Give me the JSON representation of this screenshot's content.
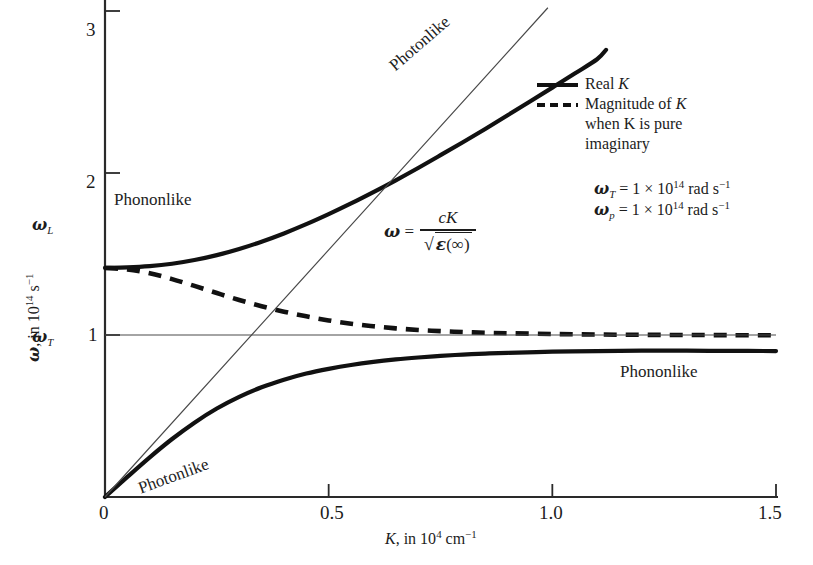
{
  "chart_data": {
    "type": "line",
    "title": "",
    "xlabel": "K, in 10^4 cm^-1",
    "ylabel": "ω, in 10^14 s^-1",
    "xlim": [
      0,
      1.5
    ],
    "ylim": [
      0,
      3.1
    ],
    "xticks": [
      "0",
      "0.5",
      "1.0",
      "1.5"
    ],
    "xtick_values": [
      0,
      0.5,
      1.0,
      1.5
    ],
    "yticks": [
      "1",
      "2",
      "3"
    ],
    "ytick_values": [
      1,
      2,
      3
    ],
    "grid": false,
    "legend_position": "upper-right",
    "special_levels": [
      {
        "name": "omega_T",
        "label": "ω",
        "sub": "T",
        "value": 1.0
      },
      {
        "name": "omega_L",
        "label": "ω",
        "sub": "L",
        "value": 1.41
      }
    ],
    "series": [
      {
        "name": "Upper polariton branch (Real K)",
        "style": "solid",
        "annotation": "Photonlike",
        "points": [
          [
            0.0,
            1.414
          ],
          [
            0.05,
            1.417
          ],
          [
            0.1,
            1.425
          ],
          [
            0.15,
            1.44
          ],
          [
            0.2,
            1.463
          ],
          [
            0.25,
            1.493
          ],
          [
            0.3,
            1.531
          ],
          [
            0.35,
            1.576
          ],
          [
            0.4,
            1.627
          ],
          [
            0.45,
            1.684
          ],
          [
            0.5,
            1.746
          ],
          [
            0.55,
            1.812
          ],
          [
            0.6,
            1.882
          ],
          [
            0.65,
            1.955
          ],
          [
            0.7,
            2.031
          ],
          [
            0.75,
            2.11
          ],
          [
            0.8,
            2.19
          ],
          [
            0.85,
            2.272
          ],
          [
            0.9,
            2.356
          ],
          [
            0.95,
            2.441
          ],
          [
            1.0,
            2.527
          ],
          [
            1.05,
            2.614
          ],
          [
            1.1,
            2.702
          ],
          [
            1.12,
            2.76
          ]
        ]
      },
      {
        "name": "Lower polariton branch (Real K)",
        "style": "solid",
        "annotations": [
          "Photonlike",
          "Phononlike"
        ],
        "points": [
          [
            0.0,
            0.0
          ],
          [
            0.05,
            0.124
          ],
          [
            0.1,
            0.245
          ],
          [
            0.15,
            0.358
          ],
          [
            0.2,
            0.459
          ],
          [
            0.25,
            0.546
          ],
          [
            0.3,
            0.618
          ],
          [
            0.35,
            0.677
          ],
          [
            0.4,
            0.724
          ],
          [
            0.45,
            0.762
          ],
          [
            0.5,
            0.791
          ],
          [
            0.55,
            0.815
          ],
          [
            0.6,
            0.834
          ],
          [
            0.65,
            0.849
          ],
          [
            0.7,
            0.861
          ],
          [
            0.75,
            0.871
          ],
          [
            0.8,
            0.879
          ],
          [
            0.85,
            0.885
          ],
          [
            0.9,
            0.89
          ],
          [
            1.0,
            0.897
          ],
          [
            1.1,
            0.901
          ],
          [
            1.2,
            0.903
          ],
          [
            1.3,
            0.903
          ],
          [
            1.4,
            0.902
          ],
          [
            1.5,
            0.901
          ]
        ]
      },
      {
        "name": "Magnitude of K when K is pure imaginary",
        "style": "dashed",
        "points": [
          [
            0.0,
            1.414
          ],
          [
            0.05,
            1.405
          ],
          [
            0.1,
            1.381
          ],
          [
            0.15,
            1.345
          ],
          [
            0.2,
            1.303
          ],
          [
            0.25,
            1.259
          ],
          [
            0.3,
            1.216
          ],
          [
            0.35,
            1.178
          ],
          [
            0.4,
            1.144
          ],
          [
            0.45,
            1.115
          ],
          [
            0.5,
            1.09
          ],
          [
            0.55,
            1.07
          ],
          [
            0.6,
            1.054
          ],
          [
            0.65,
            1.041
          ],
          [
            0.7,
            1.031
          ],
          [
            0.75,
            1.024
          ],
          [
            0.8,
            1.018
          ],
          [
            0.85,
            1.014
          ],
          [
            0.9,
            1.011
          ],
          [
            1.0,
            1.006
          ],
          [
            1.1,
            1.003
          ],
          [
            1.2,
            1.001
          ],
          [
            1.3,
            1.0
          ],
          [
            1.4,
            0.999
          ],
          [
            1.5,
            0.998
          ]
        ]
      },
      {
        "name": "Light line omega = cK / sqrt(eps(inf))",
        "style": "thin-solid",
        "annotation": "ω = cK / √ε(∞)",
        "points": [
          [
            0.0,
            0.0
          ],
          [
            0.99,
            3.02
          ]
        ]
      },
      {
        "name": "omega_T horizontal reference line",
        "style": "thin-solid",
        "points": [
          [
            0.0,
            1.0
          ],
          [
            1.5,
            1.0
          ]
        ]
      }
    ]
  },
  "axes": {
    "x_title_main": "K",
    "x_title_rest": ", in 10",
    "x_title_exp": "4",
    "x_title_unit": "cm",
    "x_title_unit_exp": "−1",
    "y_title_main": "ω",
    "y_title_rest": ", in 10",
    "y_title_exp": "14",
    "y_title_unit": "s",
    "y_title_unit_exp": "−1",
    "xticks": [
      "0",
      "0.5",
      "1.0",
      "1.5"
    ],
    "yticks": [
      "3",
      "2",
      "1"
    ],
    "omega_L_label": "ω",
    "omega_L_sub": "L",
    "omega_T_label": "ω",
    "omega_T_sub": "T"
  },
  "legend": {
    "real_k": "Real ",
    "real_k_sym": "K",
    "magnitude_line1": "Magnitude of ",
    "magnitude_line1_sym": "K",
    "magnitude_line2_a": "when ",
    "magnitude_line2_sym": "K",
    "magnitude_line2_b": " is pure",
    "magnitude_line3": "imaginary"
  },
  "params": {
    "omega_T_sym": "ω",
    "omega_T_sub": "T",
    "omega_T_eq": " = 1 × 10",
    "omega_T_exp": "14",
    "omega_T_unit": " rad s",
    "omega_T_unit_exp": "−1",
    "omega_p_sym": "ω",
    "omega_p_sub": "p",
    "omega_p_eq": " = 1 × 10",
    "omega_p_exp": "14",
    "omega_p_unit": " rad s",
    "omega_p_unit_exp": "−1"
  },
  "equation": {
    "lhs_sym": "ω",
    "equals": " = ",
    "numerator": "cK",
    "denom_sqrt": "√",
    "denom_eps": "ε",
    "denom_arg": "(∞)"
  },
  "annotations": {
    "photonlike_upper": "Photonlike",
    "phononlike_upper": "Phononlike",
    "photonlike_lower": "Photonlike",
    "phononlike_lower": "Phononlike"
  },
  "colors": {
    "curve": "#111111",
    "thin_line": "#4a4a4a",
    "axis": "#2a2a2a",
    "text": "#1c1c1c",
    "background": "#ffffff"
  }
}
